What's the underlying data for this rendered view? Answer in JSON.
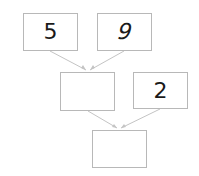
{
  "diagram": {
    "type": "addition-tree",
    "boxes": [
      {
        "id": "top-left",
        "value": "5"
      },
      {
        "id": "top-right",
        "value": "9"
      },
      {
        "id": "middle-left",
        "value": ""
      },
      {
        "id": "middle-right",
        "value": "2"
      },
      {
        "id": "bottom",
        "value": ""
      }
    ],
    "connections": [
      {
        "from": "top-left",
        "to": "middle-left"
      },
      {
        "from": "top-right",
        "to": "middle-left"
      },
      {
        "from": "middle-left",
        "to": "bottom"
      },
      {
        "from": "middle-right",
        "to": "bottom"
      }
    ],
    "colors": {
      "border": "#b8b8b8",
      "arrow": "#c4c4c4",
      "text": "#1a1a1a",
      "background": "#ffffff"
    }
  }
}
